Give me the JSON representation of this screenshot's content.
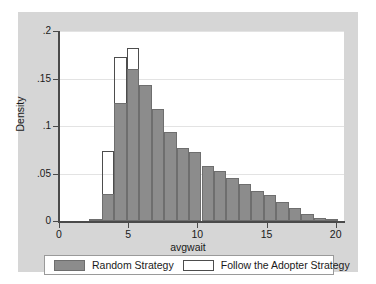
{
  "chart_data": {
    "type": "bar",
    "title": "",
    "subtitle": "",
    "xlabel": "avgwait",
    "ylabel": "Density",
    "xlim": [
      0,
      20.6
    ],
    "ylim": [
      0,
      0.2
    ],
    "xticks": [
      "0",
      "5",
      "10",
      "15",
      "20"
    ],
    "xtick_values": [
      0,
      5,
      10,
      15,
      20
    ],
    "yticks": [
      "0",
      ".05",
      ".1",
      ".15",
      ".2"
    ],
    "ytick_values": [
      0,
      0.05,
      0.1,
      0.15,
      0.2
    ],
    "grid": "horizontal",
    "legend_position": "bottom",
    "bin_width": 0.9,
    "bin_start": 2.2,
    "bin_centers": [
      2.65,
      3.55,
      4.45,
      5.35,
      6.25,
      7.15,
      8.05,
      8.95,
      9.85,
      10.75,
      11.65,
      12.55,
      13.45,
      14.35,
      15.25,
      16.15,
      17.05,
      17.95,
      18.85,
      19.75
    ],
    "series": [
      {
        "name": "Random Strategy",
        "style": "filled",
        "color": "#8c8c8c",
        "values": [
          0.001,
          0.028,
          0.124,
          0.16,
          0.143,
          0.118,
          0.094,
          0.077,
          0.073,
          0.058,
          0.053,
          0.045,
          0.039,
          0.032,
          0.027,
          0.02,
          0.014,
          0.007,
          0.003,
          0.001
        ]
      },
      {
        "name": "Follow the Adopter Strategy",
        "style": "outline",
        "color": "#ffffff",
        "values": [
          0.001,
          0.074,
          0.173,
          0.182,
          0.143,
          0.118,
          0.094,
          0.077,
          0.073,
          0.058,
          0.053,
          0.045,
          0.039,
          0.032,
          0.027,
          0.02,
          0.014,
          0.007,
          0.003,
          0.001
        ]
      }
    ]
  },
  "legend": {
    "entries": [
      {
        "label": "Random Strategy",
        "swatch": "filled"
      },
      {
        "label": "Follow the Adopter Strategy",
        "swatch": "outline"
      }
    ]
  }
}
